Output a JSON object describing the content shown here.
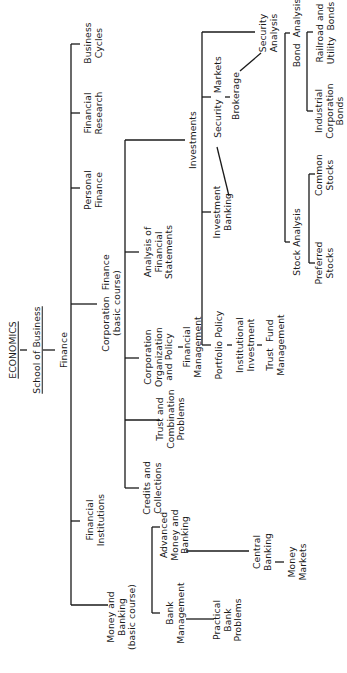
{
  "diagram": {
    "orientation": "rotated-90-ccw",
    "root": {
      "title": "ECONOMICS",
      "subtitle": "School of Business",
      "node": "Finance"
    },
    "nodes": {
      "economics": "ECONOMICS",
      "school_of_business": "School of Business",
      "finance": "Finance",
      "business_cycles": "Business\nCycles",
      "financial_research": "Financial\nResearch",
      "personal_finance": "Personal\nFinance",
      "corporation_finance": "Corporation  Finance\n(basic course)",
      "financial_institutions": "Financial\nInstitutions",
      "money_and_banking": "Money and\nBanking\n(basic course)",
      "investments": "Investments",
      "analysis_of_financial_statements": "Analysis of\nFinancial\nStatements",
      "corporation_organization": "Corporation\nOrganization\nand Policy",
      "financial_management": "Financial\nManagement",
      "trust_and_combination": "Trust and\nCombination\nProblems",
      "credits_and_collections": "Credits and\nCollections",
      "security_analysis": "Security\nAnalysis",
      "security_markets": "Security  Markets",
      "brokerage": "Brokerage",
      "investment_banking": "Investment\nBanking",
      "portfolio_policy": "Portfolio Policy",
      "institutional_investment": "Institutional\nInvestment",
      "trust_fund_management": "Trust  Fund\nManagement",
      "bond_analysis": "Bond  Analysis",
      "railroad_utility_bonds": "Railroad and\nUtility  Bonds",
      "industrial_corporation_bonds": "Industrial\nCorporation\nBonds",
      "stock_analysis": "Stock Analysis",
      "common_stocks": "Common\nStocks",
      "preferred_stocks": "Preferred\nStocks",
      "bank_management": "Bank\nManagement",
      "advanced_money_banking": "Advanced\nMoney and\nBanking",
      "practical_bank_problems": "Practical\nBank\nProblems",
      "central_banking": "Central\nBanking",
      "money_markets": "Money\nMarkets"
    },
    "line_color": "#1a1a1a",
    "background": "#ffffff"
  }
}
